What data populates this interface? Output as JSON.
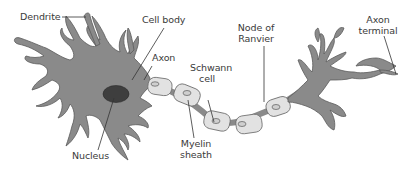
{
  "diagram": {
    "colors": {
      "cell_fill": "#8a8a8a",
      "cell_stroke": "#5a5a5a",
      "nucleus_fill": "#3e3e3e",
      "myelin_fill": "#e2e2e2",
      "myelin_stroke": "#6a6a6a",
      "node_fill": "#8a8a8a",
      "label_text": "#3a3a3a",
      "leader_line": "#333333"
    },
    "labels": {
      "dendrite": "Dendrite",
      "cell_body": "Cell body",
      "axon": "Axon",
      "schwann_cell_line1": "Schwann",
      "schwann_cell_line2": "cell",
      "node_of_ranvier_line1": "Node of",
      "node_of_ranvier_line2": "Ranvier",
      "axon_terminal_line1": "Axon",
      "axon_terminal_line2": "terminal",
      "nucleus": "Nucleus",
      "myelin_sheath_line1": "Myelin",
      "myelin_sheath_line2": "sheath"
    }
  }
}
